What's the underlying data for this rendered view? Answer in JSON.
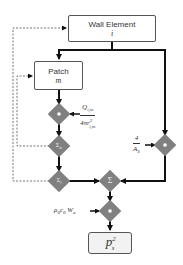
{
  "diagram": {
    "nodes": {
      "wall_element": {
        "label": "Wall Element",
        "var": "i"
      },
      "patch": {
        "label": "Patch",
        "var": "m"
      },
      "product_1": {
        "symbol": "•"
      },
      "sum_m": {
        "symbol": "Σm"
      },
      "sum_i": {
        "symbol": "Σi"
      },
      "sum": {
        "symbol": "Σ"
      },
      "product_right": {
        "symbol": "•"
      },
      "product_2": {
        "symbol": "•"
      },
      "output": {
        "label": "p",
        "sub": "s",
        "sup": "2"
      }
    },
    "inputs": {
      "q_over_r": {
        "numerator": "Q",
        "numerator_sub": "i,m",
        "denominator": "4πr",
        "denominator_sup": "2",
        "denominator_sub": "i,m"
      },
      "four_over_as": {
        "numerator": "4",
        "denominator": "A",
        "denominator_sub": "S"
      },
      "rho_c_w": {
        "text": "ρ",
        "sub1": "0",
        "text2": "c",
        "sub2": "0",
        "text3": " W",
        "sub3": "a"
      }
    },
    "colors": {
      "diamond": "#808080",
      "line": "#111111",
      "dashed": "#666666",
      "box_border": "#555555",
      "output_fill": "#f2f2f2"
    }
  }
}
